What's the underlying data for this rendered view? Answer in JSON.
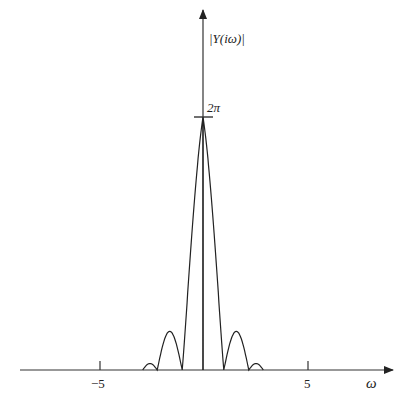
{
  "chart_data": {
    "type": "line",
    "title": "",
    "xlabel": "ω",
    "ylabel": "|Y(iω)|",
    "x_ticks": [
      {
        "value": -5,
        "label": "−5"
      },
      {
        "value": 5,
        "label": "5"
      }
    ],
    "y_ticks": [
      {
        "value": 6.2832,
        "label": "2π"
      }
    ],
    "xlim": [
      -8.9,
      9.1
    ],
    "ylim": [
      0,
      8.0
    ],
    "grid": false,
    "legend": null,
    "series": [
      {
        "name": "|Y(iω)|",
        "description": "Magnitude spectrum with main lobe peak 2π at ω=0, zeros near ω=±1, side lobes between ±1 and ±2.2, small lobes between ±2.2 and ±2.9",
        "x": [
          -2.9,
          -2.7,
          -2.55,
          -2.4,
          -2.2,
          -2.0,
          -1.8,
          -1.6,
          -1.45,
          -1.3,
          -1.15,
          -1.0,
          -0.8,
          -0.6,
          -0.4,
          -0.2,
          0.0,
          0.2,
          0.4,
          0.6,
          0.8,
          1.0,
          1.15,
          1.3,
          1.45,
          1.6,
          1.8,
          2.0,
          2.2,
          2.4,
          2.55,
          2.7,
          2.9
        ],
        "y": [
          0.0,
          0.12,
          0.16,
          0.12,
          0.0,
          0.4,
          0.75,
          0.96,
          0.95,
          0.8,
          0.45,
          0.0,
          1.55,
          3.0,
          4.3,
          5.5,
          6.2832,
          5.5,
          4.3,
          3.0,
          1.55,
          0.0,
          0.45,
          0.8,
          0.95,
          0.96,
          0.75,
          0.4,
          0.0,
          0.12,
          0.16,
          0.12,
          0.0
        ]
      }
    ],
    "annotations": [
      "vertical line at ω=0 from axis to peak"
    ]
  },
  "labels": {
    "y_axis": "|Y(iω)|",
    "peak": "2π",
    "x_neg5": "−5",
    "x_pos5": "5",
    "x_axis": "ω"
  }
}
